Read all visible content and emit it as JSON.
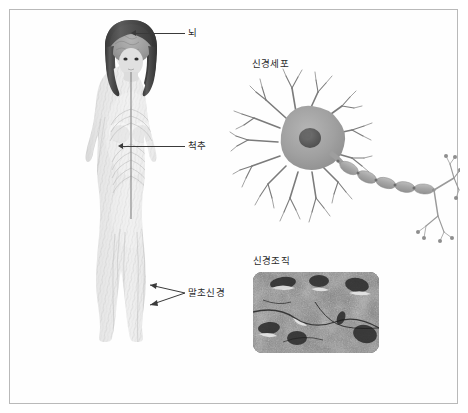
{
  "figure": {
    "background_color": "#ffffff",
    "frame_color": "#b9b9b9",
    "width": 468,
    "height": 413
  },
  "labels": {
    "brain": "뇌",
    "spine": "척추",
    "peripheral_nerve": "말초신경",
    "nerve_cell": "신경세포",
    "nerve_tissue": "신경조직"
  },
  "panels": {
    "body_figure": {
      "name": "human-nervous-system-figure",
      "description_parts": [
        "brain",
        "spinal-cord",
        "peripheral-nerves"
      ],
      "skin_tone": "#d8d8d8",
      "hair_color": "#4a4a4a",
      "brain_color": "#9e9e9e"
    },
    "neuron": {
      "name": "neuron-diagram",
      "soma_color": "#9d9d9d",
      "nucleus_color": "#5e5e5e",
      "myelin_color": "#a8a8a8",
      "axon_color": "#b0b0b0"
    },
    "micrograph": {
      "name": "nerve-tissue-micrograph",
      "style": "grayscale-histology",
      "corner_radius": 9
    }
  },
  "leaders": {
    "brain": {
      "x1": 136,
      "x2": 185,
      "y": 33
    },
    "spine": {
      "x1": 123,
      "x2": 185,
      "y": 146
    },
    "periph": {
      "x1": 150,
      "x2": 185,
      "y": 293
    }
  },
  "colors": {
    "label_text": "#2b2b2b",
    "leader_line": "#3a3a3a"
  }
}
